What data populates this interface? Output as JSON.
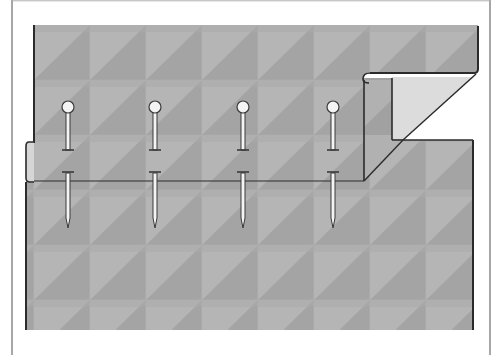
{
  "figure": {
    "title": "",
    "colors": {
      "background": "#ffffff",
      "frame": "#8a8a8a",
      "fabric_light": "#b4b4b4",
      "fabric_dark": "#a3a3a3",
      "fabric_grid": "#adadad",
      "flap_underside": "#dcdcdc",
      "outline": "#2b2b2b",
      "pin_fill": "#f4f4f4",
      "pin_stroke": "#3a3a3a"
    },
    "grid": {
      "cell_width": 56,
      "cell_height": 55,
      "origin_x": 34,
      "origin_y": 25
    },
    "pins": [
      {
        "label": "pin-1",
        "x": 68
      },
      {
        "label": "pin-2",
        "x": 155
      },
      {
        "label": "pin-3",
        "x": 243
      },
      {
        "label": "pin-4",
        "x": 333
      }
    ],
    "pin_geometry": {
      "head_y": 107,
      "head_r": 6,
      "upper_end_y": 150,
      "crossbar_y": 172,
      "tip_y": 228
    },
    "fold_line_y": 181
  }
}
